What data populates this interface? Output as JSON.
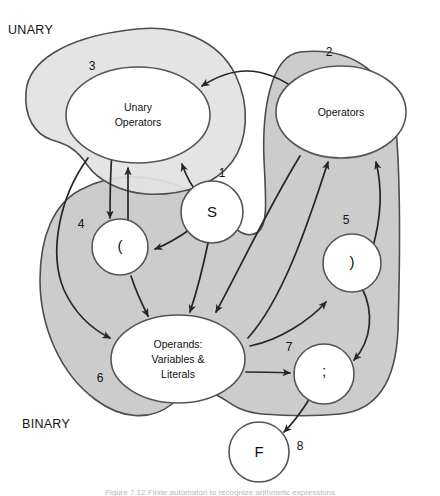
{
  "figure": {
    "caption": "Figure 7.12 Finite automaton to recognize arithmetic expressions",
    "background_color": "#ffffff",
    "region_light_gray": "#e2e2e2",
    "region_gray": "#cccccc",
    "outline_color": "#4d4d4d",
    "edge_color": "#262626"
  },
  "regions": [
    {
      "id": "unary",
      "label": "UNARY",
      "number": "3",
      "fill": "#e2e2e2"
    },
    {
      "id": "binary",
      "label": "BINARY",
      "number": "6",
      "fill": "#cccccc"
    }
  ],
  "nodes": [
    {
      "id": "s",
      "number": "1",
      "label": "S",
      "shape": "circle"
    },
    {
      "id": "operators",
      "number": "2",
      "label": "Operators",
      "shape": "ellipse"
    },
    {
      "id": "unary-ops",
      "number": "3",
      "label_line1": "Unary",
      "label_line2": "Operators",
      "shape": "ellipse"
    },
    {
      "id": "lparen",
      "number": "4",
      "label": "(",
      "shape": "circle"
    },
    {
      "id": "rparen",
      "number": "5",
      "label": ")",
      "shape": "circle"
    },
    {
      "id": "operands",
      "number": "6",
      "label_line1": "Operands:",
      "label_line2": "Variables &",
      "label_line3": "Literals",
      "shape": "ellipse"
    },
    {
      "id": "semicolon",
      "number": "7",
      "label": ";",
      "shape": "circle"
    },
    {
      "id": "f",
      "number": "8",
      "label": "F",
      "shape": "circle"
    }
  ],
  "edges": [
    {
      "from": "s",
      "to": "unary-ops"
    },
    {
      "from": "s",
      "to": "lparen"
    },
    {
      "from": "s",
      "to": "operands"
    },
    {
      "from": "unary-ops",
      "to": "lparen"
    },
    {
      "from": "lparen",
      "to": "unary-ops"
    },
    {
      "from": "unary-ops",
      "to": "operands"
    },
    {
      "from": "lparen",
      "to": "operands"
    },
    {
      "from": "operators",
      "to": "unary-ops"
    },
    {
      "from": "operators",
      "to": "operands"
    },
    {
      "from": "operands",
      "to": "operators"
    },
    {
      "from": "operands",
      "to": "rparen"
    },
    {
      "from": "operands",
      "to": "semicolon"
    },
    {
      "from": "rparen",
      "to": "operators"
    },
    {
      "from": "rparen",
      "to": "semicolon"
    },
    {
      "from": "semicolon",
      "to": "f"
    }
  ]
}
